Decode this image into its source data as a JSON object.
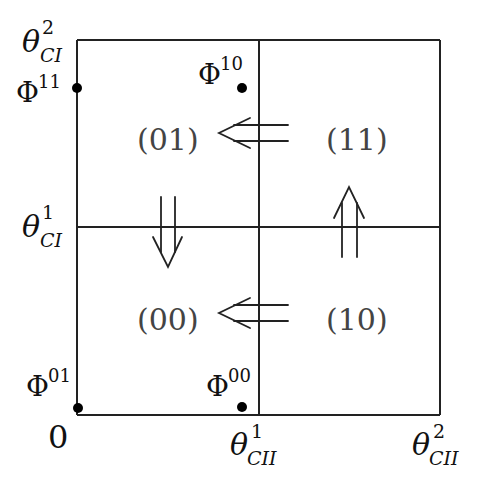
{
  "diagram": {
    "type": "phase-space partition",
    "colors": {
      "lines": "#222222",
      "labels": "#111111",
      "region_labels": "#444444",
      "points": "#000000"
    },
    "origin_label": "0",
    "axis_labels": {
      "y_tick_1": {
        "base": "θ",
        "sup": "1",
        "sub": "CI"
      },
      "y_tick_2": {
        "base": "θ",
        "sup": "2",
        "sub": "CI"
      },
      "x_tick_1": {
        "base": "θ",
        "sup": "1",
        "sub": "CII"
      },
      "x_tick_2": {
        "base": "θ",
        "sup": "2",
        "sub": "CII"
      }
    },
    "regions": [
      {
        "id": "01",
        "label": "(01)",
        "position": "top-left"
      },
      {
        "id": "11",
        "label": "(11)",
        "position": "top-right"
      },
      {
        "id": "00",
        "label": "(00)",
        "position": "bottom-left"
      },
      {
        "id": "10",
        "label": "(10)",
        "position": "bottom-right"
      }
    ],
    "fixed_points": [
      {
        "label": {
          "base": "Φ",
          "sup": "11"
        },
        "position": "left edge, upper"
      },
      {
        "label": {
          "base": "Φ",
          "sup": "10"
        },
        "position": "near top of vertical divider"
      },
      {
        "label": {
          "base": "Φ",
          "sup": "01"
        },
        "position": "origin corner"
      },
      {
        "label": {
          "base": "Φ",
          "sup": "00"
        },
        "position": "bottom, near vertical divider"
      }
    ],
    "transitions": [
      {
        "from": "11",
        "to": "01",
        "direction": "left"
      },
      {
        "from": "01",
        "to": "00",
        "direction": "down"
      },
      {
        "from": "10",
        "to": "00",
        "direction": "left"
      },
      {
        "from": "10",
        "to": "11",
        "direction": "up"
      }
    ]
  }
}
